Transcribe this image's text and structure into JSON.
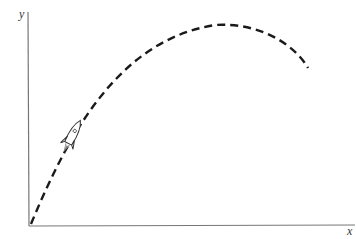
{
  "diagram": {
    "type": "trajectory",
    "axes": {
      "x_label": "x",
      "y_label": "y"
    },
    "trajectory": {
      "style": "dashed",
      "description": "parabolic path from origin rising to a peak and descending"
    },
    "object": {
      "icon": "rocket-icon"
    }
  }
}
